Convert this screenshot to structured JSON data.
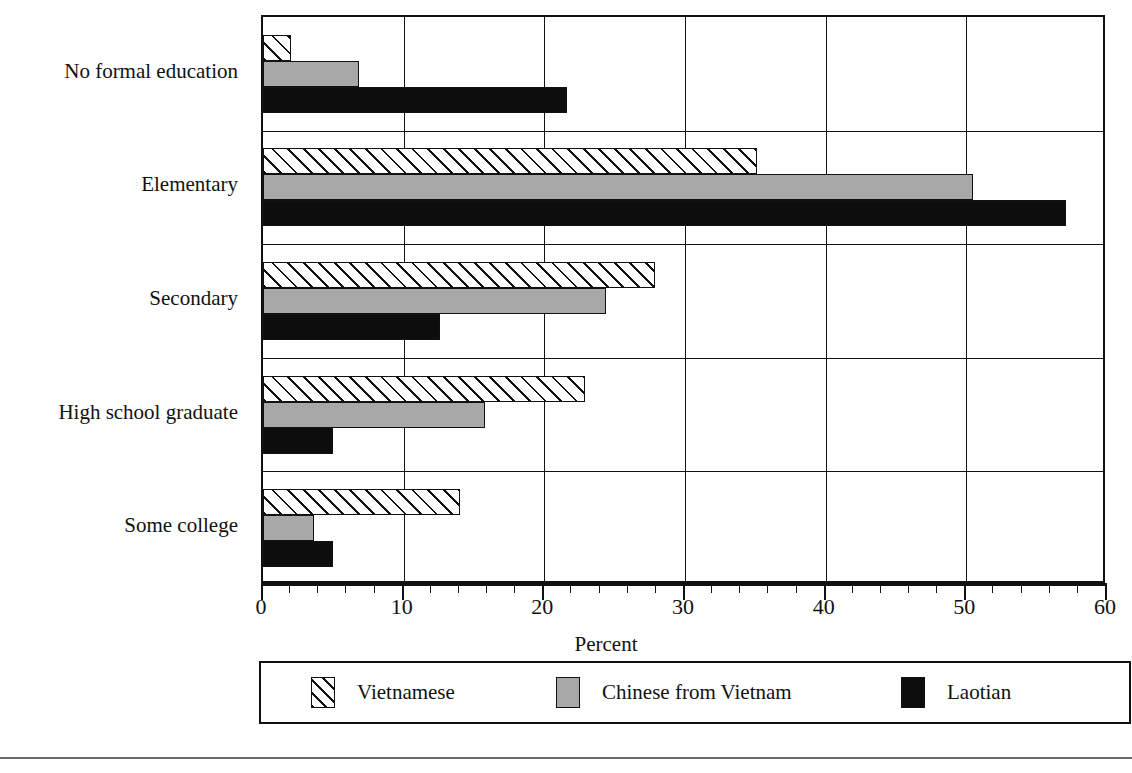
{
  "chart_data": {
    "type": "bar",
    "orientation": "horizontal",
    "title": "",
    "xlabel": "Percent",
    "ylabel": "",
    "xlim": [
      0,
      60
    ],
    "xticks": [
      0,
      10,
      20,
      30,
      40,
      50,
      60
    ],
    "xtick_labels": [
      "0",
      "10",
      "20",
      "30",
      "40",
      "50",
      "60"
    ],
    "minor_tick_interval": 2,
    "grid": "vertical-major-and-category-separators",
    "legend_position": "below-axis",
    "categories": [
      "No formal education",
      "Elementary",
      "Secondary",
      "High school graduate",
      "Some college"
    ],
    "series": [
      {
        "name": "Vietnamese",
        "pattern": "diagonal-hatch",
        "color": "#ffffff",
        "values": [
          2.0,
          35.1,
          27.9,
          22.9,
          14.0
        ]
      },
      {
        "name": "Chinese from Vietnam",
        "pattern": "solid-gray",
        "color": "#a8a8a8",
        "values": [
          6.8,
          50.5,
          24.4,
          15.8,
          3.6
        ]
      },
      {
        "name": "Laotian",
        "pattern": "solid-black",
        "color": "#0d0d0d",
        "values": [
          21.6,
          57.1,
          12.6,
          5.0,
          5.0
        ]
      }
    ]
  },
  "axis": {
    "x_title": "Percent",
    "tick_labels": [
      "0",
      "10",
      "20",
      "30",
      "40",
      "50",
      "60"
    ]
  },
  "categories": [
    {
      "label": "No formal education"
    },
    {
      "label": "Elementary"
    },
    {
      "label": "Secondary"
    },
    {
      "label": "High school graduate"
    },
    {
      "label": "Some college"
    }
  ],
  "legend": {
    "entries": [
      {
        "label": "Vietnamese"
      },
      {
        "label": "Chinese from Vietnam"
      },
      {
        "label": "Laotian"
      }
    ]
  },
  "colors": {
    "axis": "#111111",
    "series_vietnamese": "#ffffff",
    "series_chinese_from_vietnam": "#a8a8a8",
    "series_laotian": "#0d0d0d"
  }
}
